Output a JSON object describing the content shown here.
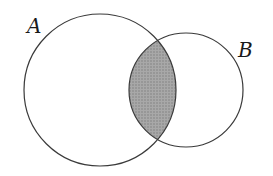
{
  "diagram": {
    "type": "venn",
    "title": "",
    "sets": [
      {
        "label": "A",
        "cx": 100,
        "cy": 90,
        "r": 76
      },
      {
        "label": "B",
        "cx": 186,
        "cy": 90,
        "r": 57
      }
    ],
    "shaded_region": "A ∩ B",
    "colors": {
      "stroke": "#3a3a3a",
      "shade": "#9a9a9a",
      "background": "#ffffff"
    }
  }
}
